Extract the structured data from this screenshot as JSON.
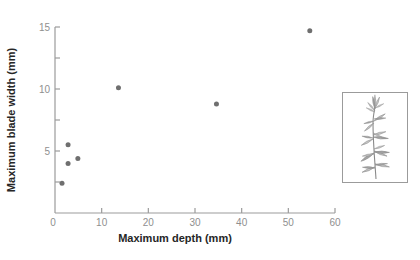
{
  "chart_data": {
    "type": "scatter",
    "title": "",
    "xlabel": "Maximum depth (mm)",
    "ylabel": "Maximum blade width (mm)",
    "xlim": [
      0,
      60
    ],
    "ylim": [
      0,
      15
    ],
    "x_ticks_labeled": [
      0,
      10,
      20,
      30,
      40,
      50,
      60
    ],
    "y_ticks_labeled": [
      5,
      10,
      15
    ],
    "y_ticks_minor": [
      2.5,
      7.5,
      12.5
    ],
    "grid": false,
    "legend": "none",
    "series": [
      {
        "name": "blade-width-vs-depth",
        "points": [
          {
            "x": 1.5,
            "y": 2.4
          },
          {
            "x": 2.8,
            "y": 5.5
          },
          {
            "x": 2.8,
            "y": 4.0
          },
          {
            "x": 4.9,
            "y": 4.4
          },
          {
            "x": 13.6,
            "y": 10.1
          },
          {
            "x": 34.6,
            "y": 8.8
          },
          {
            "x": 54.6,
            "y": 14.7
          }
        ]
      }
    ],
    "marker": {
      "shape": "circle",
      "radius_px": 2.5,
      "color": "#6f6f6f"
    }
  },
  "colors": {
    "background": "#ffffff",
    "axis_line": "#9b9b9b",
    "tick_label": "#8f8f8f",
    "axis_title": "#262626",
    "marker": "#6f6f6f",
    "inset_border": "#9b9b9b",
    "plant_stroke": "#8a8a8a",
    "plant_fill_light": "#c4c4c4",
    "plant_fill_dark": "#a3a3a3"
  },
  "inset": {
    "icon": "plant-sprig-illustration"
  }
}
